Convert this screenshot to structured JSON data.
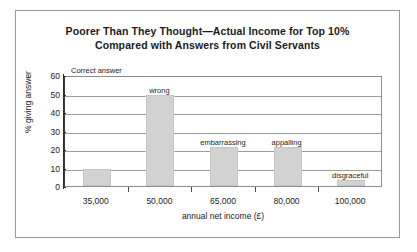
{
  "chart_data": {
    "type": "bar",
    "title": "Poorer Than They Thought—Actual Income for Top 10% Compared with Answers from Civil Servants",
    "title_lines": [
      "Poorer Than They Thought—Actual Income for Top 10%",
      "Compared with Answers from Civil Servants"
    ],
    "xlabel": "annual net income (£)",
    "ylabel": "% giving answer",
    "categories": [
      "35,000",
      "50,000",
      "65,000",
      "80,000",
      "100,000"
    ],
    "values": [
      9,
      49,
      21,
      21,
      3
    ],
    "bar_labels": [
      "",
      "wrong",
      "embarrassing",
      "appalling",
      "disgraceful"
    ],
    "ylim": [
      0,
      60
    ],
    "yticks": [
      0,
      10,
      20,
      30,
      40,
      50,
      60
    ],
    "ytick_labels": [
      "0",
      "10",
      "20",
      "30",
      "40",
      "50",
      "60"
    ],
    "grid": true,
    "grid_axis": "y",
    "legend": "none",
    "annotations": [
      {
        "text": "Correct answer",
        "target": "35,000",
        "position": "plot-top-left"
      },
      {
        "text": "wrong",
        "target": "50,000",
        "position": "above-bar"
      },
      {
        "text": "embarrassing",
        "target": "65,000",
        "position": "above-bar"
      },
      {
        "text": "appalling",
        "target": "80,000",
        "position": "above-bar"
      },
      {
        "text": "disgraceful",
        "target": "100,000",
        "position": "above-bar"
      }
    ],
    "bar_color": "#d2d2d2",
    "axis_color": "#2e2e2e",
    "grid_color": "#9c9c9c",
    "background": "#ffffff"
  }
}
